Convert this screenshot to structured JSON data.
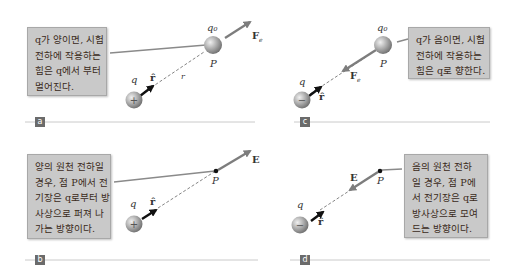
{
  "panels": {
    "a": {
      "tag": "a",
      "callout": [
        "q가 양이면, 시험",
        "전하에 작용하는",
        "힘은 q에서 부터",
        "멀어진다."
      ],
      "labels": {
        "q": "q",
        "q0": "q₀",
        "P": "P",
        "r_hat": "r̂",
        "r": "r",
        "force": "F",
        "force_sub": "e"
      },
      "source_sign": "+"
    },
    "b": {
      "tag": "b",
      "callout": [
        "양의 원천 전하일",
        "경우, 점 P에서 전",
        "기장은 q로부터 방",
        "사상으로 퍼져 나",
        "가는 방향이다."
      ],
      "labels": {
        "q": "q",
        "P": "P",
        "r_hat": "r̂",
        "field": "E"
      },
      "source_sign": "+"
    },
    "c": {
      "tag": "c",
      "callout": [
        "q가 음이면, 시험",
        "전하에 작용하는",
        "힘은 q로 향한다."
      ],
      "labels": {
        "q": "q",
        "q0": "q₀",
        "P": "P",
        "r_hat": "r̂",
        "force": "F",
        "force_sub": "e"
      },
      "source_sign": "−"
    },
    "d": {
      "tag": "d",
      "callout": [
        "음의 원천 전하",
        "일 경우, 점 P에",
        "서 전기장은 q로",
        "방사상으로 모여",
        "드는 방향이다."
      ],
      "labels": {
        "q": "q",
        "P": "P",
        "r_hat": "r̂",
        "field": "E"
      },
      "source_sign": "−"
    }
  },
  "colors": {
    "callout_bg": "#c9c9c9",
    "vector": "#8a8a8a",
    "unit_vector": "#111111",
    "charge": "#9a9a9a",
    "divider": "#bdbdbd",
    "tag_bg": "#6b6b6b"
  }
}
